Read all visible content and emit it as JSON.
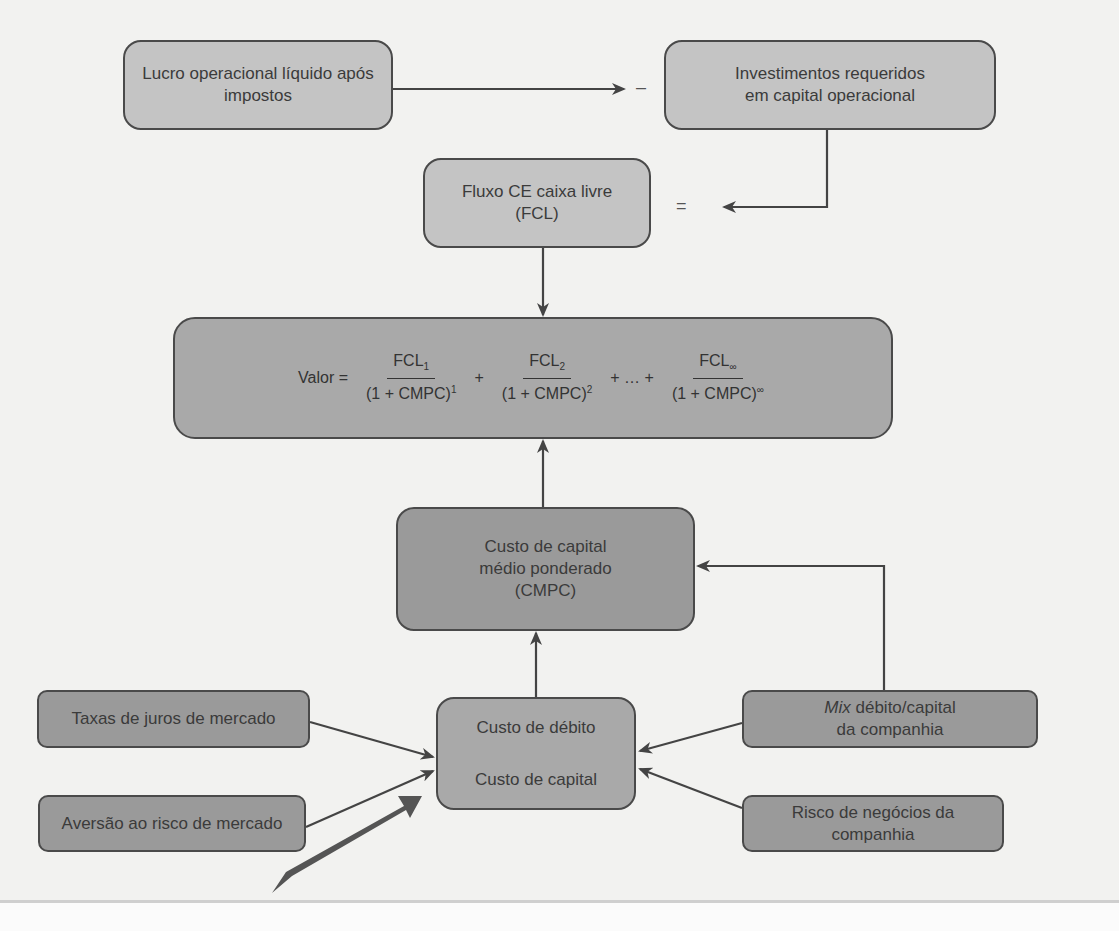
{
  "diagram": {
    "nodes": {
      "lucro": {
        "label_line1": "Lucro operacional líquido após",
        "label_line2": "impostos"
      },
      "investimentos": {
        "label_line1": "Investimentos requeridos",
        "label_line2": "em capital operacional"
      },
      "fcl": {
        "label_line1": "Fluxo CE caixa livre",
        "label_line2": "(FCL)"
      },
      "valor": {
        "lhs": "Valor =",
        "terms": [
          {
            "num": "FCL",
            "num_sub": "1",
            "den": "(1 + CMPC)",
            "den_sup": "1"
          },
          {
            "num": "FCL",
            "num_sub": "2",
            "den": "(1 + CMPC)",
            "den_sup": "2"
          },
          {
            "num": "FCL",
            "num_sub": "∞",
            "den": "(1 + CMPC)",
            "den_sup": "∞"
          }
        ],
        "op_plus": "+",
        "op_ellipsis": "+ … +"
      },
      "cmpc": {
        "label_line1": "Custo de capital",
        "label_line2": "médio ponderado",
        "label_line3": "(CMPC)"
      },
      "custos": {
        "label_line1": "Custo de débito",
        "label_line2": "Custo de capital"
      },
      "taxas": {
        "label": "Taxas de juros de mercado"
      },
      "aversao": {
        "label": "Aversão ao risco de mercado"
      },
      "mix": {
        "label_italic": "Mix",
        "label_rest": " débito/capital",
        "label_line2": "da companhia"
      },
      "risco": {
        "label_line1": "Risco de negócios da",
        "label_line2": "companhia"
      }
    },
    "operators": {
      "minus": "–",
      "equals": "="
    },
    "colors": {
      "light_box": "#c4c4c4",
      "mid_box": "#a9a9a9",
      "dark_box": "#9a9a9a",
      "stroke": "#4a4a4a",
      "background": "#f2f2f0"
    }
  }
}
